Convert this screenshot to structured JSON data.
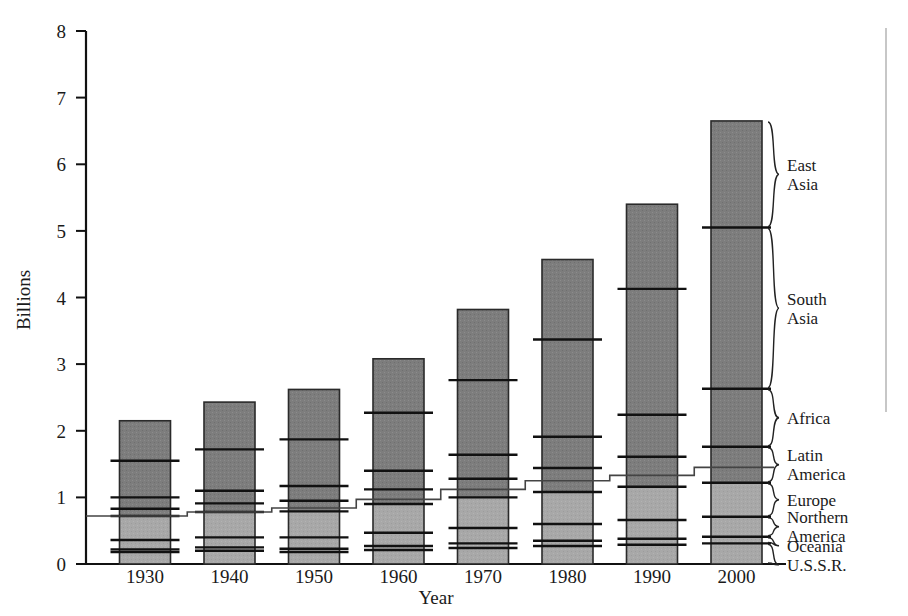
{
  "chart_data": {
    "type": "bar",
    "title": "",
    "subtitle": "",
    "xlabel": "Year",
    "ylabel": "Billions",
    "categories": [
      "1930",
      "1940",
      "1950",
      "1960",
      "1970",
      "1980",
      "1990",
      "2000"
    ],
    "ylim": [
      0,
      8
    ],
    "yticks": [
      0,
      1,
      2,
      3,
      4,
      5,
      6,
      7,
      8
    ],
    "ytick_labels": [
      "0",
      "1",
      "2",
      "3",
      "4",
      "5",
      "6",
      "7",
      "8"
    ],
    "grid": false,
    "legend_position": "right-braces",
    "stacked": true,
    "stack_order_bottom_to_top": [
      "U.S.S.R.",
      "Oceania",
      "Northern America",
      "Europe",
      "Latin America",
      "Africa",
      "South Asia",
      "East Asia"
    ],
    "series": [
      {
        "name": "U.S.S.R.",
        "shade": "light",
        "values": [
          0.18,
          0.2,
          0.18,
          0.21,
          0.24,
          0.27,
          0.29,
          0.31
        ]
      },
      {
        "name": "Oceania",
        "shade": "light",
        "values": [
          0.04,
          0.05,
          0.05,
          0.06,
          0.07,
          0.08,
          0.09,
          0.1
        ]
      },
      {
        "name": "Northern America",
        "shade": "light",
        "values": [
          0.14,
          0.15,
          0.17,
          0.2,
          0.23,
          0.25,
          0.28,
          0.3
        ]
      },
      {
        "name": "Europe",
        "shade": "light",
        "values": [
          0.36,
          0.38,
          0.39,
          0.43,
          0.46,
          0.48,
          0.5,
          0.51
        ]
      },
      {
        "name": "Latin America",
        "shade": "dark",
        "values": [
          0.11,
          0.13,
          0.16,
          0.22,
          0.28,
          0.36,
          0.45,
          0.54
        ]
      },
      {
        "name": "Africa",
        "shade": "dark",
        "values": [
          0.17,
          0.19,
          0.22,
          0.28,
          0.36,
          0.47,
          0.63,
          0.87
        ]
      },
      {
        "name": "South Asia",
        "shade": "dark",
        "values": [
          0.55,
          0.62,
          0.7,
          0.87,
          1.12,
          1.46,
          1.89,
          2.42
        ]
      },
      {
        "name": "East Asia",
        "shade": "dark",
        "values": [
          0.6,
          0.71,
          0.75,
          0.81,
          1.06,
          1.2,
          1.27,
          1.6
        ]
      }
    ],
    "totals": [
      2.15,
      2.43,
      2.62,
      3.08,
      3.82,
      4.65,
      5.82,
      7.65
    ],
    "overlay_step_line": {
      "name": "developed-developing-boundary",
      "values": [
        0.72,
        0.78,
        0.84,
        0.97,
        1.12,
        1.25,
        1.33,
        1.45
      ]
    }
  },
  "axes": {
    "y_title": "Billions",
    "x_title": "Year"
  },
  "region_labels": [
    {
      "key": "east-asia",
      "lines": [
        "East",
        "Asia"
      ]
    },
    {
      "key": "south-asia",
      "lines": [
        "South",
        "Asia"
      ]
    },
    {
      "key": "africa",
      "lines": [
        "Africa"
      ]
    },
    {
      "key": "latin-america",
      "lines": [
        "Latin",
        "America"
      ]
    },
    {
      "key": "europe",
      "lines": [
        "Europe"
      ]
    },
    {
      "key": "northern-america",
      "lines": [
        "Northern",
        "America"
      ]
    },
    {
      "key": "oceania",
      "lines": [
        "Oceania"
      ]
    },
    {
      "key": "ussr",
      "lines": [
        "U.S.S.R."
      ]
    }
  ],
  "colors": {
    "dark_fill": "#7d7d7d",
    "light_fill": "#a8a8a8",
    "outline": "#2a2a2a",
    "divider": "#111111",
    "axis": "#111111",
    "text": "#1a1a1a",
    "background": "#ffffff",
    "edge_rule": "#b9b9b9"
  }
}
